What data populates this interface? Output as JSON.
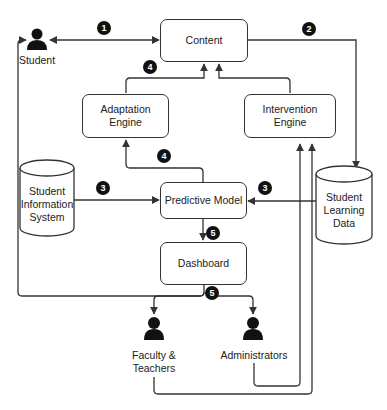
{
  "diagram": {
    "nodes": {
      "content": "Content",
      "adaptation_engine": "Adaptation\nEngine",
      "intervention_engine": "Intervention\nEngine",
      "predictive_model": "Predictive Model",
      "dashboard": "Dashboard",
      "student_information_system": "Student\nInformation\nSystem",
      "student_learning_data": "Student\nLearning\nData"
    },
    "actors": {
      "student": "Student",
      "faculty": "Faculty &\nTeachers",
      "administrators": "Administrators"
    },
    "badges": {
      "b1": "1",
      "b2": "2",
      "b3a": "3",
      "b3b": "3",
      "b4a": "4",
      "b4b": "4",
      "b5a": "5",
      "b5b": "5"
    },
    "colors": {
      "line": "#333333",
      "badge": "#111111",
      "actor": "#111111"
    }
  }
}
